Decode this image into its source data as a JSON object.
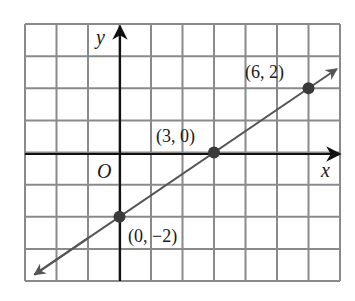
{
  "chart_data": {
    "type": "line",
    "title": "",
    "xlabel": "x",
    "ylabel": "y",
    "origin_label": "O",
    "grid": true,
    "xlim": [
      -3,
      7
    ],
    "ylim": [
      -4,
      4
    ],
    "series": [
      {
        "name": "line",
        "equation": "y = (2/3)x - 2",
        "slope": 0.6667,
        "y_intercept": -2,
        "arrows_both_ends": true,
        "x": [
          -3,
          7
        ],
        "y": [
          -4,
          2.6667
        ]
      }
    ],
    "points": [
      {
        "x": 0,
        "y": -2,
        "label": "(0, −2)"
      },
      {
        "x": 3,
        "y": 0,
        "label": "(3, 0)"
      },
      {
        "x": 6,
        "y": 2,
        "label": "(6, 2)"
      }
    ]
  },
  "colors": {
    "grid": "#8a8a8a",
    "axis": "#111111",
    "line": "#555555",
    "point": "#3a3a3a"
  }
}
